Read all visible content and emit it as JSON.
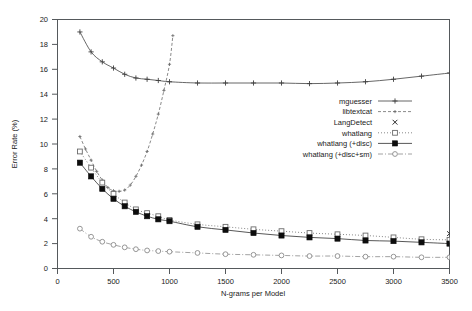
{
  "chart_data": {
    "type": "line",
    "title": "",
    "xlabel": "N-grams per Model",
    "ylabel": "Error Rate (%)",
    "xlim": [
      0,
      3500
    ],
    "ylim": [
      0,
      20
    ],
    "xticks": [
      0,
      500,
      1000,
      1500,
      2000,
      2500,
      3000,
      3500
    ],
    "yticks": [
      0,
      2,
      4,
      6,
      8,
      10,
      12,
      14,
      16,
      18,
      20
    ],
    "grid": false,
    "legend_position": "center-right",
    "series": [
      {
        "name": "mguesser",
        "marker": "plus",
        "line": "solid",
        "color": "#404040",
        "x": [
          200,
          300,
          400,
          500,
          600,
          700,
          800,
          900,
          1000,
          1250,
          1500,
          1750,
          2000,
          2250,
          2500,
          2750,
          3000,
          3250,
          3500
        ],
        "y": [
          19.0,
          17.4,
          16.6,
          16.1,
          15.6,
          15.3,
          15.2,
          15.1,
          15.0,
          14.9,
          14.9,
          14.9,
          14.9,
          14.85,
          14.9,
          15.0,
          15.2,
          15.45,
          15.7
        ]
      },
      {
        "name": "libtextcat",
        "marker": "plus-small",
        "line": "dashed",
        "color": "#6b6b6b",
        "x": [
          200,
          250,
          300,
          350,
          400,
          450,
          500,
          550,
          600,
          650,
          700,
          750,
          800,
          850,
          900,
          950,
          1000,
          1030
        ],
        "y": [
          10.6,
          9.6,
          8.7,
          7.8,
          7.1,
          6.5,
          6.25,
          6.2,
          6.3,
          6.7,
          7.4,
          8.3,
          9.4,
          10.8,
          12.4,
          14.3,
          16.4,
          18.7
        ]
      },
      {
        "name": "LangDetect",
        "marker": "cross",
        "line": "none",
        "color": "#2a2a2a",
        "x": [
          3500
        ],
        "y": [
          2.8
        ]
      },
      {
        "name": "whatlang",
        "marker": "open-square",
        "line": "dotted",
        "color": "#6b6b6b",
        "x": [
          200,
          300,
          400,
          500,
          600,
          700,
          800,
          900,
          1000,
          1250,
          1500,
          1750,
          2000,
          2250,
          2500,
          2750,
          3000,
          3250,
          3500
        ],
        "y": [
          9.4,
          8.1,
          6.9,
          6.0,
          5.3,
          4.75,
          4.45,
          4.2,
          3.9,
          3.55,
          3.35,
          3.15,
          3.0,
          2.85,
          2.75,
          2.65,
          2.5,
          2.35,
          2.3
        ]
      },
      {
        "name": "whatlang (+disc)",
        "marker": "filled-square",
        "line": "solid-thin",
        "color": "#101010",
        "x": [
          200,
          300,
          400,
          500,
          600,
          700,
          800,
          900,
          1000,
          1250,
          1500,
          1750,
          2000,
          2250,
          2500,
          2750,
          3000,
          3250,
          3500
        ],
        "y": [
          8.5,
          7.4,
          6.4,
          5.6,
          5.0,
          4.55,
          4.2,
          3.95,
          3.8,
          3.35,
          3.1,
          2.85,
          2.65,
          2.5,
          2.4,
          2.25,
          2.2,
          2.1,
          2.0
        ]
      },
      {
        "name": "whatlang (+disc+sm)",
        "marker": "open-diamond",
        "line": "dash-dot",
        "color": "#8a8a8a",
        "x": [
          200,
          300,
          400,
          500,
          600,
          700,
          800,
          900,
          1000,
          1250,
          1500,
          1750,
          2000,
          2250,
          2500,
          2750,
          3000,
          3250,
          3500
        ],
        "y": [
          3.2,
          2.55,
          2.15,
          1.9,
          1.7,
          1.55,
          1.45,
          1.4,
          1.35,
          1.25,
          1.15,
          1.1,
          1.05,
          1.0,
          1.0,
          0.95,
          0.95,
          0.9,
          0.9
        ]
      }
    ]
  },
  "axes": {
    "x_title": "N-grams per Model",
    "y_title": "Error Rate (%)",
    "x_tick_labels": [
      "0",
      "500",
      "1000",
      "1500",
      "2000",
      "2500",
      "3000",
      "3500"
    ],
    "y_tick_labels": [
      "0",
      "2",
      "4",
      "6",
      "8",
      "10",
      "12",
      "14",
      "16",
      "18",
      "20"
    ]
  },
  "legend": {
    "entries": [
      {
        "label": "mguesser"
      },
      {
        "label": "libtextcat"
      },
      {
        "label": "LangDetect"
      },
      {
        "label": "whatlang"
      },
      {
        "label": "whatlang (+disc)"
      },
      {
        "label": "whatlang (+disc+sm)"
      }
    ]
  }
}
